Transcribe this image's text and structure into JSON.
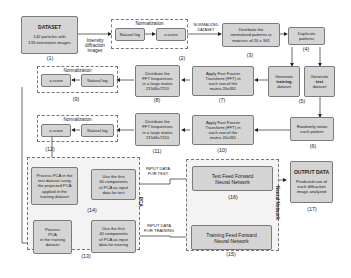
{
  "diagram": {
    "nodes": {
      "dataset": {
        "title": "DATASET",
        "line1": "142 particles with",
        "line2": "133 orientation images",
        "num": "(1)"
      },
      "normalization_top": {
        "title": "Normalization",
        "natural_log": "Natural log",
        "zscore": "z-score",
        "num": "(2)"
      },
      "distribute_norm": {
        "line1": "Distribute the",
        "line2": "normalized patterns in",
        "line3": "matrices of 20 x 361",
        "num": "(3)"
      },
      "duplicate": {
        "line1": "Duplicate",
        "line2": "patterns",
        "num": "(4)"
      },
      "gen_training": {
        "line1": "Generate",
        "line2": "training",
        "line3": "dataset"
      },
      "gen_test": {
        "line1": "Generate",
        "line2": "test",
        "line3": "dataset",
        "num": "(5)"
      },
      "rotate": {
        "line1": "Randomly rotate",
        "line2": "each pattern",
        "num": "(6)"
      },
      "fft_train": {
        "line1": "Apply Fast Fourier",
        "line2": "Transform (FFT) in",
        "line3": "each row of the",
        "line4": "matrix 20x361",
        "num": "(7)"
      },
      "distribute_fft_train": {
        "line1": "Distribute the",
        "line2": "FFT frequencies",
        "line3": "in a large matrix",
        "line4": "21546x7220",
        "num": "(8)"
      },
      "normalization_9": {
        "title": "Normalization",
        "natural_log": "Natural log",
        "zscore": "z-score",
        "num": "(9)"
      },
      "fft_test": {
        "line1": "Apply Fast Fourier",
        "line2": "Transform (FFT) in",
        "line3": "each row of the",
        "line4": "matrix 20x361",
        "num": "(10)"
      },
      "distribute_fft_test": {
        "line1": "Distribute the",
        "line2": "FFT frequencies",
        "line3": "in a large matrix",
        "line4": "21546x7220",
        "num": "(11)"
      },
      "normalization_12": {
        "title": "Normalization",
        "natural_log": "Natural log",
        "zscore": "z-score",
        "num": "(12)"
      },
      "pca_test": {
        "line1": "Process PCA in the",
        "line2": "test dataset using",
        "line3": "the projected PCA",
        "line4": "applied in the",
        "line5": "training dataset"
      },
      "use40_test": {
        "line1": "Use the first",
        "line2": "40 components",
        "line3": "of PCA as input",
        "line4": "data for test",
        "num": "(14)"
      },
      "pca_train": {
        "line1": "Process",
        "line2": "PCA",
        "line3": "in the training",
        "line4": "dataset",
        "num": "(13)"
      },
      "use40_train": {
        "line1": "Use the first",
        "line2": "40 components",
        "line3": "of PCA as input",
        "line4": "data for training"
      },
      "nn_test": {
        "line1": "Test Feed Forward",
        "line2": "Neural Network",
        "num": "(16)"
      },
      "nn_train": {
        "line1": "Training Feed Forward",
        "line2": "Neural Network",
        "num": "(15)"
      },
      "output": {
        "title": "OUTPUT DATA",
        "line1": "Predicted size of",
        "line2": "each diffraction",
        "line3": "image analyzed",
        "num": "(17)"
      }
    },
    "edge_labels": {
      "intensity": [
        "Intensity",
        "diffraction",
        "images"
      ],
      "normalized": [
        "NORMALIZED",
        "DATASET"
      ],
      "input_test": [
        "INPUT DATA",
        "FOR TEST"
      ],
      "input_training": [
        "INPUT DATA",
        "FOR TRAINING"
      ]
    },
    "groups": {
      "pca": "PCA",
      "neural_network": "Neural Network"
    }
  }
}
